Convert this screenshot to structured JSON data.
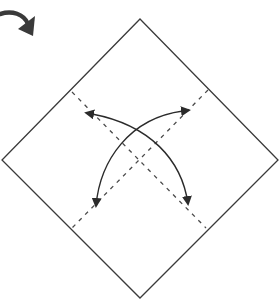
{
  "diagram": {
    "type": "origami-fold-step",
    "colors": {
      "background": "#ffffff",
      "paper_outline": "#3a3a3a",
      "crease": "#4a4a4a",
      "arrow": "#2b2b2b",
      "turn_arrow": "#3a3a3a"
    },
    "elements": [
      {
        "id": "turn-over-arrow",
        "kind": "curved-arrow",
        "label": ""
      },
      {
        "id": "paper-square",
        "kind": "diamond",
        "vertices": [
          [
            140,
            19
          ],
          [
            278,
            160
          ],
          [
            140,
            298
          ],
          [
            2,
            160
          ]
        ]
      },
      {
        "id": "crease-1",
        "kind": "dashed-line",
        "from": [
          72,
          92
        ],
        "to": [
          206,
          228
        ]
      },
      {
        "id": "crease-2",
        "kind": "dashed-line",
        "from": [
          208,
          90
        ],
        "to": [
          72,
          228
        ]
      },
      {
        "id": "fold-arrow-1",
        "kind": "curved-double-arrow",
        "from": [
          90,
          113
        ],
        "to": [
          188,
          207
        ]
      },
      {
        "id": "fold-arrow-2",
        "kind": "curved-double-arrow",
        "from": [
          184,
          111
        ],
        "to": [
          95,
          209
        ]
      }
    ]
  }
}
